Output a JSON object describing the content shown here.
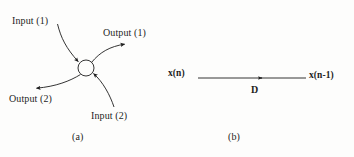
{
  "figure": {
    "background_color": "#fdfdfc",
    "ink_color": "#1d1d1d",
    "panels": [
      {
        "id": "a",
        "caption": "(a)",
        "node": {
          "shape": "circle",
          "cx": 86,
          "cy": 68,
          "r": 8,
          "fill": "none"
        },
        "edges": [
          {
            "name": "input-1",
            "label": "Input (1)",
            "direction": "into-node",
            "curved": true,
            "from": [
              58,
              25
            ],
            "to": [
              80,
              62
            ]
          },
          {
            "name": "output-1",
            "label": "Output (1)",
            "direction": "out-of-node",
            "curved": true,
            "from": [
              93,
              63
            ],
            "to": [
              126,
              44
            ]
          },
          {
            "name": "output-2",
            "label": "Output (2)",
            "direction": "out-of-node",
            "curved": true,
            "from": [
              80,
              74
            ],
            "to": [
              35,
              88
            ]
          },
          {
            "name": "input-2",
            "label": "Input (2)",
            "direction": "into-node",
            "curved": true,
            "from": [
              113,
              106
            ],
            "to": [
              93,
              73
            ]
          }
        ]
      },
      {
        "id": "b",
        "caption": "(b)",
        "source_label": "x(n)",
        "result_label": "x(n-1)",
        "operator_label": "D",
        "edge": {
          "name": "delay-arrow",
          "from": [
            198,
            78
          ],
          "to": [
            305,
            78
          ],
          "arrowhead_at": [
            262,
            78
          ]
        }
      }
    ]
  },
  "labels": {
    "input_1": "Input (1)",
    "output_1": "Output (1)",
    "output_2": "Output (2)",
    "input_2": "Input (2)",
    "caption_a": "(a)",
    "x_n": "x(n)",
    "x_n_minus_1": "x(n-1)",
    "delay_operator": "D",
    "caption_b": "(b)"
  }
}
